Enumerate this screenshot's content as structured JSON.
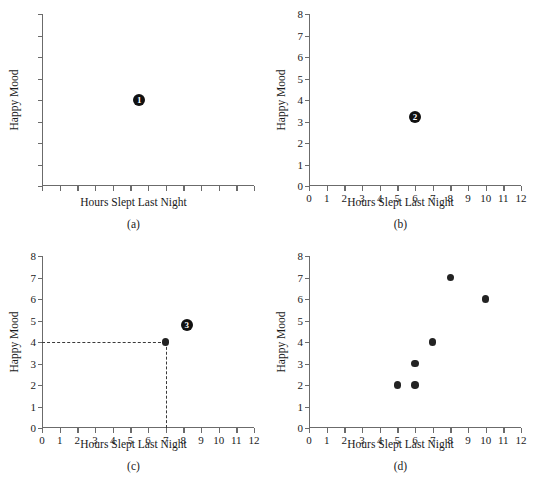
{
  "figure": {
    "axis_title_x": "Hours Slept Last Night",
    "axis_title_y": "Happy Mood",
    "point_color": "#232323",
    "axis_color": "#6b6b6b",
    "guide_color": "#3a3a3a",
    "background": "#ffffff"
  },
  "chart_data": [
    {
      "type": "scatter",
      "panel": "a",
      "caption": "(a)",
      "title": "",
      "xlabel": "Hours Slept Last Night",
      "ylabel": "Happy Mood",
      "xlim": [
        0,
        12
      ],
      "ylim": [
        0,
        8
      ],
      "xticks": [
        0,
        1,
        2,
        3,
        4,
        5,
        6,
        7,
        8,
        9,
        10,
        11,
        12
      ],
      "yticks": [
        0,
        1,
        2,
        3,
        4,
        5,
        6,
        7,
        8
      ],
      "xticklabels": [
        "",
        "",
        "",
        "",
        "",
        "",
        "",
        "",
        "",
        "",
        "",
        "",
        ""
      ],
      "yticklabels": [
        "",
        "",
        "",
        "",
        "",
        "",
        "",
        "",
        ""
      ],
      "grid": false,
      "legend": "none",
      "points": [],
      "annotations": [
        {
          "label": "1",
          "x": 5.5,
          "y": 4.0
        }
      ]
    },
    {
      "type": "scatter",
      "panel": "b",
      "caption": "(b)",
      "title": "",
      "xlabel": "Hours Slept Last Night",
      "ylabel": "Happy Mood",
      "xlim": [
        0,
        12
      ],
      "ylim": [
        0,
        8
      ],
      "xticks": [
        0,
        1,
        2,
        3,
        4,
        5,
        6,
        7,
        8,
        9,
        10,
        11,
        12
      ],
      "yticks": [
        0,
        1,
        2,
        3,
        4,
        5,
        6,
        7,
        8
      ],
      "xticklabels": [
        "0",
        "1",
        "2",
        "3",
        "4",
        "5",
        "6",
        "7",
        "8",
        "9",
        "10",
        "11",
        "12"
      ],
      "yticklabels": [
        "0",
        "1",
        "2",
        "3",
        "4",
        "5",
        "6",
        "7",
        "8"
      ],
      "grid": false,
      "legend": "none",
      "points": [],
      "annotations": [
        {
          "label": "2",
          "x": 6.0,
          "y": 3.2
        }
      ]
    },
    {
      "type": "scatter",
      "panel": "c",
      "caption": "(c)",
      "title": "",
      "xlabel": "Hours Slept Last Night",
      "ylabel": "Happy Mood",
      "xlim": [
        0,
        12
      ],
      "ylim": [
        0,
        8
      ],
      "xticks": [
        0,
        1,
        2,
        3,
        4,
        5,
        6,
        7,
        8,
        9,
        10,
        11,
        12
      ],
      "yticks": [
        0,
        1,
        2,
        3,
        4,
        5,
        6,
        7,
        8
      ],
      "xticklabels": [
        "0",
        "1",
        "2",
        "3",
        "4",
        "5",
        "6",
        "7",
        "8",
        "9",
        "10",
        "11",
        "12"
      ],
      "yticklabels": [
        "0",
        "1",
        "2",
        "3",
        "4",
        "5",
        "6",
        "7",
        "8"
      ],
      "grid": false,
      "legend": "none",
      "points": [
        {
          "x": 7,
          "y": 4
        }
      ],
      "guides": [
        {
          "orientation": "horizontal",
          "from_x": 0,
          "to_x": 7,
          "y": 4
        },
        {
          "orientation": "vertical",
          "x": 7,
          "from_y": 0,
          "to_y": 4
        }
      ],
      "annotations": [
        {
          "label": "3",
          "x": 8.2,
          "y": 4.8
        }
      ]
    },
    {
      "type": "scatter",
      "panel": "d",
      "caption": "(d)",
      "title": "",
      "xlabel": "Hours Slept Last Night",
      "ylabel": "Happy Mood",
      "xlim": [
        0,
        12
      ],
      "ylim": [
        0,
        8
      ],
      "xticks": [
        0,
        1,
        2,
        3,
        4,
        5,
        6,
        7,
        8,
        9,
        10,
        11,
        12
      ],
      "yticks": [
        0,
        1,
        2,
        3,
        4,
        5,
        6,
        7,
        8
      ],
      "xticklabels": [
        "0",
        "1",
        "2",
        "3",
        "4",
        "5",
        "6",
        "7",
        "8",
        "9",
        "10",
        "11",
        "12"
      ],
      "yticklabels": [
        "0",
        "1",
        "2",
        "3",
        "4",
        "5",
        "6",
        "7",
        "8"
      ],
      "grid": false,
      "legend": "none",
      "points": [
        {
          "x": 5,
          "y": 2
        },
        {
          "x": 6,
          "y": 2
        },
        {
          "x": 6,
          "y": 3
        },
        {
          "x": 7,
          "y": 4
        },
        {
          "x": 8,
          "y": 7
        },
        {
          "x": 10,
          "y": 6
        }
      ],
      "annotations": []
    }
  ]
}
